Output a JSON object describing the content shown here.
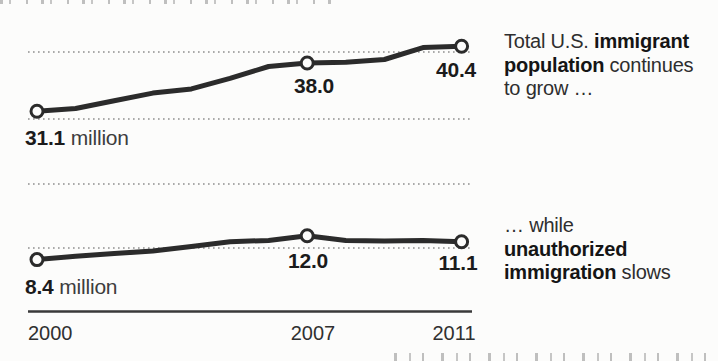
{
  "colors": {
    "background": "#fcfcfb",
    "line": "#2b2b2b",
    "grid": "#8e8e8e",
    "axis": "#3a3a3a",
    "text": "#2e2e2e"
  },
  "chart_data": {
    "type": "line",
    "x": [
      2000,
      2001,
      2002,
      2003,
      2004,
      2005,
      2006,
      2007,
      2008,
      2009,
      2010,
      2011
    ],
    "x_ticks": [
      "2000",
      "2007",
      "2011"
    ],
    "marker_years": [
      2000,
      2007,
      2011
    ],
    "unit": "million",
    "gridline_values_millions": [
      40,
      30,
      20,
      10
    ],
    "legend_position": "right",
    "series": [
      {
        "name": "Total U.S. immigrant population",
        "values": [
          31.1,
          31.5,
          32.6,
          33.7,
          34.3,
          35.8,
          37.5,
          38.0,
          38.1,
          38.5,
          40.2,
          40.4
        ],
        "labeled_points": {
          "2000": 31.1,
          "2007": 38.0,
          "2011": 40.4
        }
      },
      {
        "name": "Unauthorized immigrant population",
        "values": [
          8.4,
          8.9,
          9.3,
          9.7,
          10.4,
          11.1,
          11.3,
          12.0,
          11.3,
          11.2,
          11.3,
          11.1
        ],
        "labeled_points": {
          "2000": 8.4,
          "2007": 12.0,
          "2011": 11.1
        }
      }
    ]
  },
  "point_labels": {
    "top_2000_value": "31.1",
    "top_2000_unit": " million",
    "top_2007": "38.0",
    "top_2011": "40.4",
    "bottom_2000_value": "8.4",
    "bottom_2000_unit": " million",
    "bottom_2007": "12.0",
    "bottom_2011": "11.1"
  },
  "x_axis": {
    "ticks": [
      "2000",
      "2007",
      "2011"
    ]
  },
  "annotations": {
    "top": {
      "lines": [
        [
          {
            "text": "Total U.S. ",
            "bold": false
          },
          {
            "text": "immigrant",
            "bold": true
          }
        ],
        [
          {
            "text": "population",
            "bold": true
          },
          {
            "text": " continues",
            "bold": false
          }
        ],
        [
          {
            "text": "to grow …",
            "bold": false
          }
        ]
      ]
    },
    "bottom": {
      "lines": [
        [
          {
            "text": "… while",
            "bold": false
          }
        ],
        [
          {
            "text": "unauthorized",
            "bold": true
          }
        ],
        [
          {
            "text": "immigration",
            "bold": true
          },
          {
            "text": " slows",
            "bold": false
          }
        ]
      ]
    }
  }
}
